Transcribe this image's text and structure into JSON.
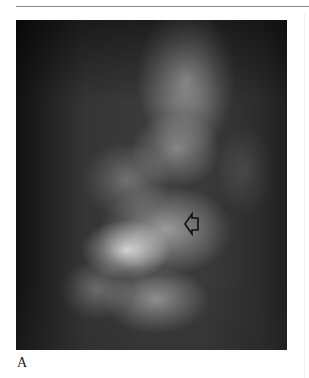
{
  "figure": {
    "panel_label": "A",
    "image_description": "Radiograph (X-ray) of spine",
    "annotation": {
      "type": "arrow",
      "direction": "left"
    }
  }
}
